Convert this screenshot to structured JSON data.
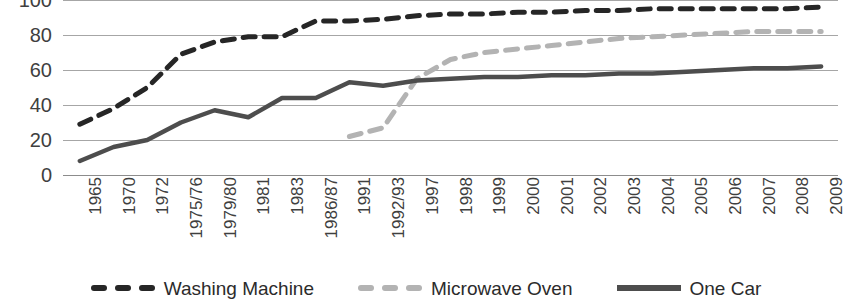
{
  "chart_data": {
    "type": "line",
    "title": "",
    "xlabel": "",
    "ylabel": "",
    "ylim": [
      0,
      100
    ],
    "ytick_values": [
      100,
      80,
      60,
      40,
      20,
      0
    ],
    "grid": true,
    "legend_position": "bottom",
    "categories": [
      "1965",
      "1970",
      "1972",
      "1975/76",
      "1979/80",
      "1981",
      "1983",
      "1986/87",
      "1991",
      "1992/93",
      "1997",
      "1998",
      "1999",
      "2000",
      "2001",
      "2002",
      "2003",
      "2004",
      "2005",
      "2006",
      "2007",
      "2008",
      "2009"
    ],
    "series": [
      {
        "name": "Washing Machine",
        "color": "#262626",
        "style": "dashed",
        "values": [
          29,
          38,
          50,
          69,
          76,
          79,
          79,
          88,
          88,
          89,
          91,
          92,
          92,
          93,
          93,
          94,
          94,
          95,
          95,
          95,
          95,
          95,
          96
        ]
      },
      {
        "name": "Microwave Oven",
        "color": "#b3b3b3",
        "style": "dashed",
        "values": [
          null,
          null,
          null,
          null,
          null,
          null,
          null,
          null,
          22,
          27,
          55,
          66,
          70,
          72,
          74,
          76,
          78,
          79,
          80,
          81,
          82,
          82,
          82
        ]
      },
      {
        "name": "One Car",
        "color": "#4d4d4d",
        "style": "solid",
        "values": [
          8,
          16,
          20,
          30,
          37,
          33,
          44,
          44,
          53,
          51,
          54,
          55,
          56,
          56,
          57,
          57,
          58,
          58,
          59,
          60,
          61,
          61,
          62
        ]
      }
    ]
  },
  "legend": {
    "items": [
      {
        "label": "Washing Machine",
        "swatch": "dashed-dark-swatch"
      },
      {
        "label": "Microwave Oven",
        "swatch": "dashed-gray-swatch"
      },
      {
        "label": "One Car",
        "swatch": "solid-dark-swatch"
      }
    ]
  },
  "colors": {
    "washing_machine": "#262626",
    "microwave_oven": "#b3b3b3",
    "one_car": "#4d4d4d",
    "gridline": "#a6a6a6",
    "text": "#3f3f3f"
  }
}
